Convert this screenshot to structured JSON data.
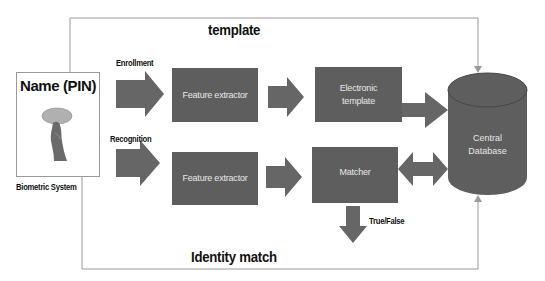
{
  "diagram": {
    "type": "biometric-system-flow",
    "colors": {
      "box_fill": "#5e5e5e",
      "box_text": "#e8e8e8",
      "arrow_fill": "#666666",
      "connector_line": "#9a9a9a",
      "label_text": "#111111"
    },
    "user_card": {
      "title": "Name (PIN)",
      "caption": "Biometric System",
      "icon": "fingerprint-icon"
    },
    "flows": {
      "enrollment_label": "Enrollment",
      "recognition_label": "Recognition"
    },
    "nodes": {
      "feature_extractor_enroll": "Feature extractor",
      "electronic_template_line1": "Electronic",
      "electronic_template_line2": "template",
      "feature_extractor_recog": "Feature extractor",
      "matcher": "Matcher",
      "database_line1": "Central",
      "database_line2": "Database"
    },
    "edges": {
      "top_connector_label": "template",
      "bottom_connector_label": "Identity match",
      "output_label": "True/False"
    }
  }
}
